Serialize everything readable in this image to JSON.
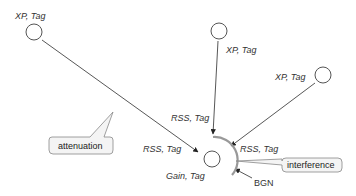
{
  "diagram": {
    "transmitters": [
      {
        "id": "tx-left",
        "label": "XP, Tag"
      },
      {
        "id": "tx-center",
        "label": "XP, Tag"
      },
      {
        "id": "tx-right",
        "label": "XP, Tag"
      }
    ],
    "receiver": {
      "label": "Gain, Tag"
    },
    "signal_labels": {
      "left": "RSS, Tag",
      "top": "RSS, Tag",
      "right": "RSS, Tag"
    },
    "noise_label": "BGN",
    "callouts": {
      "attenuation": "attenuation",
      "interference": "interference"
    },
    "colors": {
      "stroke": "#444444",
      "arc": "#999999",
      "callout_fill": "#f4f4f4"
    }
  }
}
